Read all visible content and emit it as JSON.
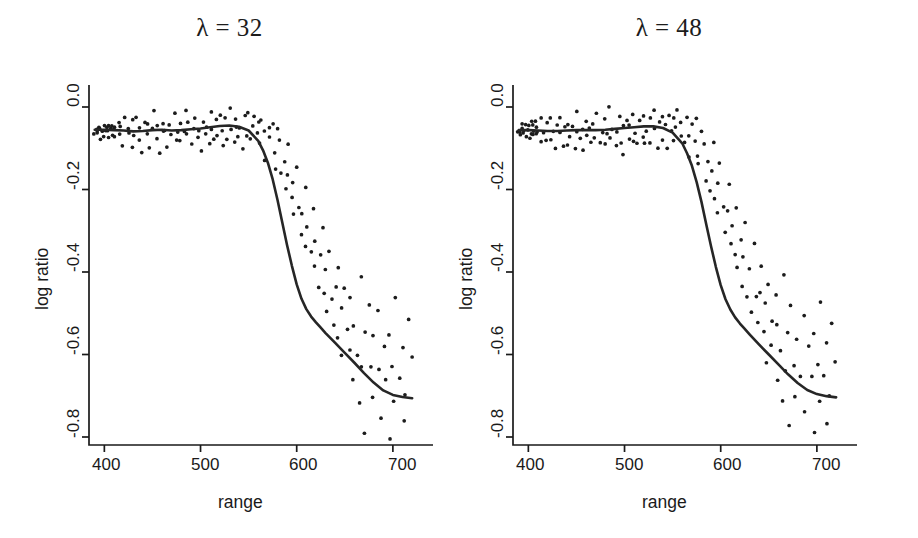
{
  "figure": {
    "background": "#ffffff",
    "ink_color": "#1a1a1a",
    "point_color": "#1c1c1c",
    "curve_color": "#262626"
  },
  "panels": [
    {
      "id": "left",
      "title": "λ = 32",
      "lambda": 32,
      "xlabel": "range",
      "ylabel": "log ratio"
    },
    {
      "id": "right",
      "title": "λ = 48",
      "lambda": 48,
      "xlabel": "range",
      "ylabel": "log ratio"
    }
  ],
  "axes": {
    "x_ticks": [
      "400",
      "500",
      "600",
      "700"
    ],
    "y_ticks": [
      "0.0",
      "-0.2",
      "-0.4",
      "-0.6",
      "-0.8"
    ]
  },
  "chart_data": {
    "type": "scatter",
    "xlabel": "range",
    "ylabel": "log ratio",
    "xlim": [
      383,
      723
    ],
    "ylim": [
      -0.95,
      0.06
    ],
    "x_ticks": [
      400,
      500,
      600,
      700
    ],
    "y_ticks": [
      0.0,
      -0.2,
      -0.4,
      -0.6,
      -0.8
    ],
    "grid": false,
    "legend": null,
    "panels": [
      {
        "name": "λ = 32",
        "lambda": 32,
        "series": [
          {
            "name": "observations",
            "type": "scatter",
            "marker": "point",
            "x": [
              390,
              391,
              392,
              393,
              394,
              395,
              396,
              397,
              398,
              399,
              400,
              401,
              402,
              403,
              404,
              405,
              406,
              407,
              408,
              409,
              410,
              412,
              414,
              416,
              418,
              420,
              422,
              424,
              426,
              428,
              430,
              432,
              434,
              436,
              438,
              440,
              442,
              444,
              446,
              448,
              450,
              452,
              454,
              456,
              458,
              460,
              462,
              464,
              466,
              468,
              470,
              472,
              474,
              476,
              478,
              480,
              482,
              484,
              486,
              488,
              490,
              492,
              494,
              496,
              498,
              500,
              502,
              504,
              506,
              508,
              510,
              512,
              514,
              516,
              518,
              520,
              522,
              524,
              526,
              528,
              530,
              532,
              534,
              536,
              538,
              540,
              542,
              544,
              546,
              548,
              550,
              552,
              554,
              556,
              558,
              560,
              562,
              564,
              566,
              568,
              570,
              572,
              574,
              576,
              578,
              580,
              582,
              584,
              586,
              588,
              590,
              592,
              594,
              596,
              598,
              600,
              602,
              604,
              606,
              608,
              610,
              612,
              614,
              616,
              618,
              620,
              622,
              624,
              626,
              628,
              630,
              632,
              634,
              636,
              638,
              640,
              642,
              644,
              646,
              648,
              650,
              652,
              654,
              656,
              658,
              660,
              662,
              664,
              666,
              668,
              670,
              672,
              674,
              676,
              678,
              680,
              682,
              684,
              686,
              688,
              690,
              692,
              694,
              696,
              698,
              700,
              702,
              704,
              706,
              708,
              710,
              712,
              714,
              716,
              718,
              720
            ],
            "y": [
              -0.055,
              -0.06,
              -0.05,
              -0.065,
              -0.045,
              -0.058,
              -0.052,
              -0.07,
              -0.048,
              -0.062,
              -0.04,
              -0.068,
              -0.055,
              -0.05,
              -0.072,
              -0.045,
              -0.06,
              -0.035,
              -0.065,
              -0.05,
              -0.058,
              -0.08,
              -0.03,
              -0.062,
              -0.045,
              -0.09,
              -0.025,
              -0.07,
              -0.05,
              -0.095,
              -0.04,
              -0.06,
              -0.02,
              -0.085,
              -0.055,
              -0.1,
              -0.035,
              -0.07,
              -0.045,
              -0.09,
              -0.06,
              -0.015,
              -0.08,
              -0.05,
              -0.105,
              -0.03,
              -0.065,
              -0.05,
              -0.095,
              -0.04,
              -0.075,
              -0.02,
              -0.085,
              -0.055,
              -0.03,
              -0.09,
              -0.06,
              -0.01,
              -0.075,
              -0.045,
              -0.1,
              -0.055,
              -0.02,
              -0.08,
              -0.05,
              -0.115,
              -0.035,
              -0.07,
              -0.05,
              -0.09,
              -0.015,
              -0.06,
              -0.085,
              -0.04,
              -0.07,
              -0.02,
              -0.095,
              -0.055,
              -0.035,
              -0.08,
              -0.01,
              -0.06,
              -0.09,
              -0.045,
              -0.02,
              -0.075,
              -0.05,
              -0.1,
              -0.03,
              -0.065,
              -0.02,
              -0.085,
              -0.05,
              -0.015,
              -0.07,
              -0.04,
              -0.09,
              -0.025,
              -0.06,
              -0.12,
              -0.05,
              -0.075,
              -0.03,
              -0.11,
              -0.145,
              -0.06,
              -0.09,
              -0.17,
              -0.13,
              -0.205,
              -0.155,
              -0.095,
              -0.23,
              -0.185,
              -0.26,
              -0.14,
              -0.235,
              -0.3,
              -0.26,
              -0.195,
              -0.33,
              -0.29,
              -0.355,
              -0.24,
              -0.395,
              -0.33,
              -0.43,
              -0.36,
              -0.29,
              -0.45,
              -0.4,
              -0.5,
              -0.34,
              -0.47,
              -0.525,
              -0.44,
              -0.39,
              -0.555,
              -0.48,
              -0.61,
              -0.43,
              -0.53,
              -0.58,
              -0.46,
              -0.67,
              -0.52,
              -0.595,
              -0.72,
              -0.41,
              -0.635,
              -0.545,
              -0.78,
              -0.48,
              -0.62,
              -0.7,
              -0.56,
              -0.83,
              -0.645,
              -0.5,
              -0.745,
              -0.59,
              -0.885,
              -0.66,
              -0.55,
              -0.8,
              -0.62,
              -0.72,
              -0.47,
              -0.9,
              -0.655,
              -0.58,
              -0.77,
              -0.69,
              -0.52,
              -0.86,
              -0.61,
              -0.73,
              -0.665,
              -0.55,
              -0.81,
              -0.64,
              -0.71,
              -0.6,
              -0.78,
              -0.67
            ]
          },
          {
            "name": "smoothing spline fit",
            "type": "line",
            "x": [
              390,
              400,
              410,
              420,
              430,
              440,
              450,
              460,
              470,
              480,
              490,
              500,
              510,
              520,
              530,
              540,
              550,
              560,
              565,
              570,
              575,
              580,
              585,
              590,
              595,
              600,
              605,
              610,
              615,
              620,
              625,
              630,
              640,
              650,
              660,
              670,
              680,
              690,
              700,
              710,
              720
            ],
            "y": [
              -0.055,
              -0.055,
              -0.056,
              -0.057,
              -0.059,
              -0.058,
              -0.056,
              -0.055,
              -0.057,
              -0.056,
              -0.054,
              -0.052,
              -0.049,
              -0.046,
              -0.045,
              -0.048,
              -0.057,
              -0.082,
              -0.105,
              -0.135,
              -0.175,
              -0.225,
              -0.28,
              -0.335,
              -0.385,
              -0.43,
              -0.465,
              -0.49,
              -0.508,
              -0.522,
              -0.535,
              -0.548,
              -0.572,
              -0.596,
              -0.62,
              -0.645,
              -0.668,
              -0.687,
              -0.698,
              -0.703,
              -0.706
            ]
          }
        ]
      },
      {
        "name": "λ = 48",
        "lambda": 48,
        "series": [
          {
            "name": "observations",
            "type": "scatter",
            "marker": "point",
            "x": [
              390,
              391,
              392,
              393,
              394,
              395,
              396,
              397,
              398,
              399,
              400,
              401,
              402,
              403,
              404,
              405,
              406,
              407,
              408,
              409,
              410,
              412,
              414,
              416,
              418,
              420,
              422,
              424,
              426,
              428,
              430,
              432,
              434,
              436,
              438,
              440,
              442,
              444,
              446,
              448,
              450,
              452,
              454,
              456,
              458,
              460,
              462,
              464,
              466,
              468,
              470,
              472,
              474,
              476,
              478,
              480,
              482,
              484,
              486,
              488,
              490,
              492,
              494,
              496,
              498,
              500,
              502,
              504,
              506,
              508,
              510,
              512,
              514,
              516,
              518,
              520,
              522,
              524,
              526,
              528,
              530,
              532,
              534,
              536,
              538,
              540,
              542,
              544,
              546,
              548,
              550,
              552,
              554,
              556,
              558,
              560,
              562,
              564,
              566,
              568,
              570,
              572,
              574,
              576,
              578,
              580,
              582,
              584,
              586,
              588,
              590,
              592,
              594,
              596,
              598,
              600,
              602,
              604,
              606,
              608,
              610,
              612,
              614,
              616,
              618,
              620,
              622,
              624,
              626,
              628,
              630,
              632,
              634,
              636,
              638,
              640,
              642,
              644,
              646,
              648,
              650,
              652,
              654,
              656,
              658,
              660,
              662,
              664,
              666,
              668,
              670,
              672,
              674,
              676,
              678,
              680,
              682,
              684,
              686,
              688,
              690,
              692,
              694,
              696,
              698,
              700,
              702,
              704,
              706,
              708,
              710,
              712,
              714,
              716,
              718,
              720
            ],
            "y": [
              -0.055,
              -0.06,
              -0.05,
              -0.065,
              -0.045,
              -0.058,
              -0.052,
              -0.07,
              -0.048,
              -0.062,
              -0.04,
              -0.068,
              -0.055,
              -0.05,
              -0.072,
              -0.045,
              -0.06,
              -0.035,
              -0.065,
              -0.05,
              -0.058,
              -0.08,
              -0.03,
              -0.062,
              -0.045,
              -0.09,
              -0.025,
              -0.07,
              -0.05,
              -0.095,
              -0.04,
              -0.06,
              -0.02,
              -0.085,
              -0.055,
              -0.1,
              -0.035,
              -0.07,
              -0.045,
              -0.09,
              -0.06,
              -0.015,
              -0.08,
              -0.05,
              -0.105,
              -0.03,
              -0.065,
              -0.05,
              -0.095,
              -0.04,
              -0.075,
              -0.02,
              -0.085,
              -0.055,
              -0.03,
              -0.09,
              -0.06,
              -0.01,
              -0.075,
              -0.045,
              -0.1,
              -0.055,
              -0.02,
              -0.08,
              -0.05,
              -0.115,
              -0.035,
              -0.07,
              -0.05,
              -0.09,
              -0.015,
              -0.06,
              -0.085,
              -0.04,
              -0.07,
              -0.02,
              -0.095,
              -0.055,
              -0.035,
              -0.08,
              -0.01,
              -0.06,
              -0.09,
              -0.045,
              -0.02,
              -0.075,
              -0.05,
              -0.1,
              -0.03,
              -0.065,
              -0.02,
              -0.085,
              -0.05,
              -0.015,
              -0.07,
              -0.04,
              -0.09,
              -0.025,
              -0.06,
              -0.12,
              -0.05,
              -0.075,
              -0.03,
              -0.11,
              -0.145,
              -0.06,
              -0.09,
              -0.17,
              -0.13,
              -0.205,
              -0.155,
              -0.095,
              -0.23,
              -0.185,
              -0.26,
              -0.14,
              -0.235,
              -0.3,
              -0.26,
              -0.195,
              -0.33,
              -0.29,
              -0.355,
              -0.24,
              -0.395,
              -0.33,
              -0.43,
              -0.36,
              -0.29,
              -0.45,
              -0.4,
              -0.5,
              -0.34,
              -0.47,
              -0.525,
              -0.44,
              -0.39,
              -0.555,
              -0.48,
              -0.61,
              -0.43,
              -0.53,
              -0.58,
              -0.46,
              -0.67,
              -0.52,
              -0.595,
              -0.72,
              -0.41,
              -0.635,
              -0.545,
              -0.78,
              -0.48,
              -0.62,
              -0.7,
              -0.56,
              -0.83,
              -0.645,
              -0.5,
              -0.745,
              -0.59,
              -0.885,
              -0.66,
              -0.55,
              -0.8,
              -0.62,
              -0.72,
              -0.47,
              -0.9,
              -0.655,
              -0.58,
              -0.77,
              -0.69,
              -0.52,
              -0.86,
              -0.61,
              -0.73,
              -0.665,
              -0.55,
              -0.81,
              -0.64,
              -0.71,
              -0.6,
              -0.78,
              -0.67
            ]
          },
          {
            "name": "smoothing spline fit",
            "type": "line",
            "x": [
              390,
              400,
              410,
              420,
              430,
              440,
              450,
              460,
              470,
              480,
              490,
              500,
              510,
              520,
              530,
              540,
              550,
              560,
              565,
              570,
              575,
              580,
              585,
              590,
              595,
              600,
              605,
              610,
              615,
              620,
              625,
              630,
              640,
              650,
              660,
              670,
              680,
              690,
              700,
              710,
              720
            ],
            "y": [
              -0.056,
              -0.056,
              -0.057,
              -0.058,
              -0.058,
              -0.057,
              -0.056,
              -0.056,
              -0.056,
              -0.055,
              -0.053,
              -0.051,
              -0.049,
              -0.047,
              -0.047,
              -0.051,
              -0.062,
              -0.088,
              -0.112,
              -0.142,
              -0.182,
              -0.23,
              -0.285,
              -0.338,
              -0.388,
              -0.432,
              -0.466,
              -0.491,
              -0.51,
              -0.525,
              -0.538,
              -0.551,
              -0.576,
              -0.6,
              -0.624,
              -0.648,
              -0.669,
              -0.686,
              -0.696,
              -0.701,
              -0.704
            ]
          }
        ]
      }
    ]
  }
}
